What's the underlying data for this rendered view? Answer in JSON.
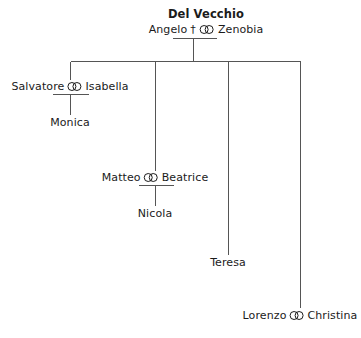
{
  "diagram": {
    "title": "Del Vecchio",
    "type": "family-tree",
    "marriage_symbol": "marriage-icon",
    "deceased_symbol": "†",
    "line_color": "#555555",
    "text_color": "#1b1b1b",
    "background": "#ffffff"
  },
  "people": {
    "angelo": "Angelo",
    "zenobia": "Zenobia",
    "salvatore": "Salvatore",
    "isabella": "Isabella",
    "monica": "Monica",
    "matteo": "Matteo",
    "beatrice": "Beatrice",
    "nicola": "Nicola",
    "teresa": "Teresa",
    "lorenzo": "Lorenzo",
    "christina": "Christina"
  },
  "generations": [
    {
      "level": 1,
      "couples": [
        {
          "id": "angelo-zenobia",
          "left": "Angelo",
          "left_deceased": true,
          "right": "Zenobia",
          "children": [
            "Salvatore",
            "Matteo",
            "Teresa",
            "Lorenzo"
          ]
        }
      ]
    },
    {
      "level": 2,
      "couples": [
        {
          "id": "salvatore-isabella",
          "left": "Salvatore",
          "left_deceased": false,
          "right": "Isabella",
          "children": [
            "Monica"
          ]
        },
        {
          "id": "matteo-beatrice",
          "left": "Matteo",
          "left_deceased": false,
          "right": "Beatrice",
          "children": [
            "Nicola"
          ]
        },
        {
          "id": "lorenzo-christina",
          "left": "Lorenzo",
          "left_deceased": false,
          "right": "Christina",
          "children": []
        }
      ],
      "singles": [
        {
          "id": "teresa",
          "name": "Teresa"
        }
      ]
    },
    {
      "level": 3,
      "singles": [
        {
          "id": "monica",
          "name": "Monica"
        },
        {
          "id": "nicola",
          "name": "Nicola"
        }
      ]
    }
  ]
}
